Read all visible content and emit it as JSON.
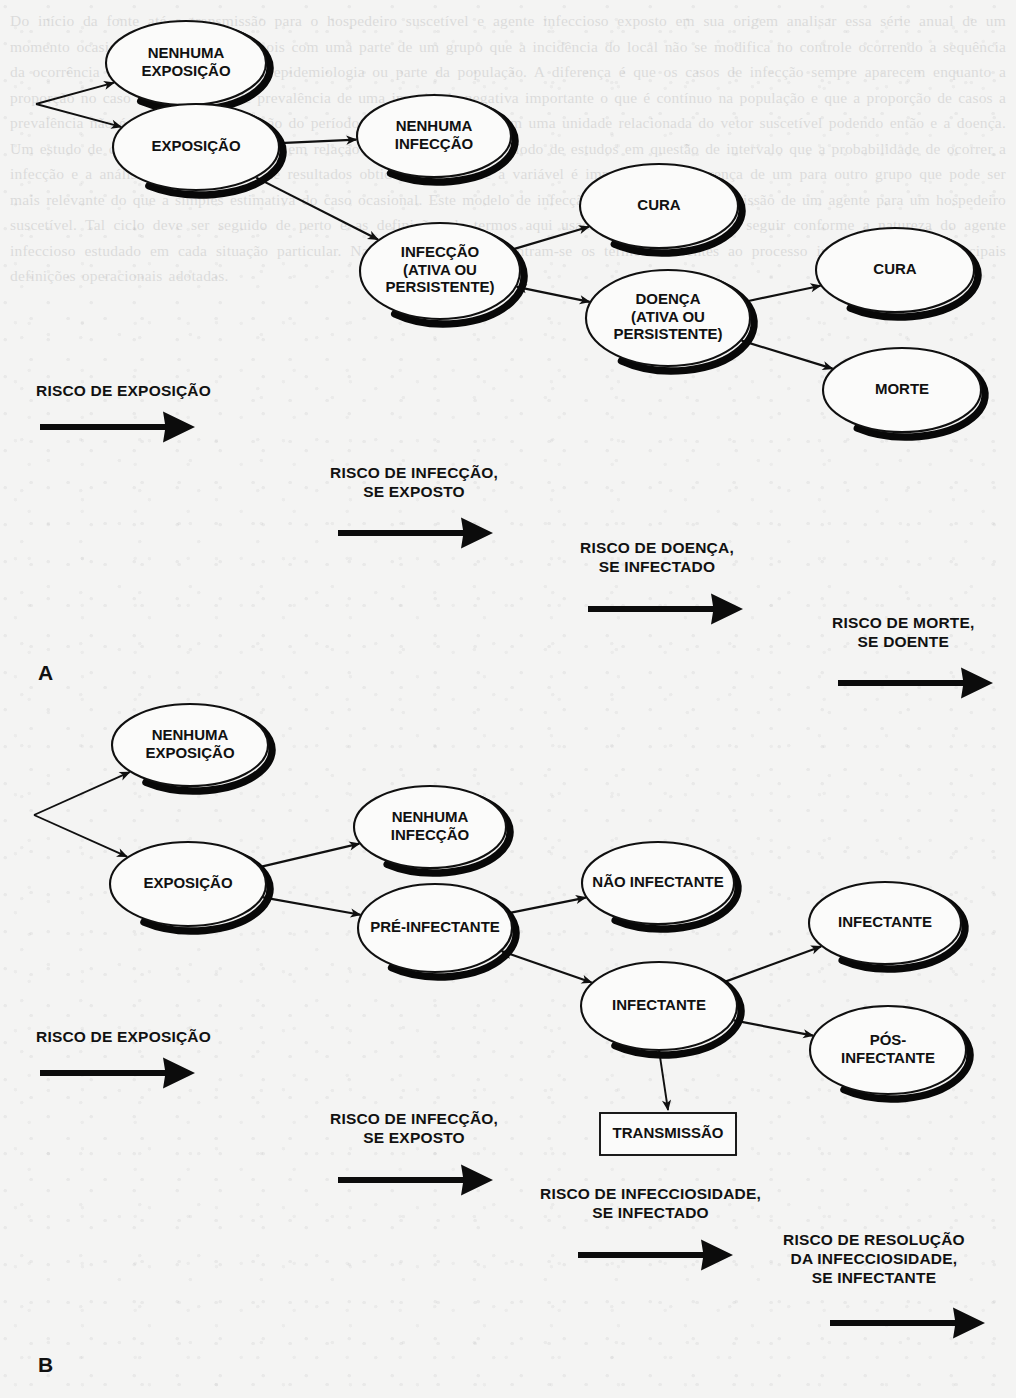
{
  "document": {
    "background_color": "#f4f4f3",
    "ink_color": "#111111"
  },
  "panels": [
    {
      "id": "A",
      "letter": "A",
      "nodes": [
        {
          "id": "a-nenhuma-exposicao",
          "lines": [
            "NENHUMA",
            "EXPOSIÇÃO"
          ],
          "shape": "ellipse",
          "cx": 186,
          "cy": 63,
          "rx": 80,
          "ry": 42
        },
        {
          "id": "a-exposicao",
          "lines": [
            "EXPOSIÇÃO"
          ],
          "shape": "ellipse",
          "cx": 196,
          "cy": 147,
          "rx": 83,
          "ry": 43
        },
        {
          "id": "a-nenhuma-infeccao",
          "lines": [
            "NENHUMA",
            "INFECÇÃO"
          ],
          "shape": "ellipse",
          "cx": 434,
          "cy": 136,
          "rx": 77,
          "ry": 41
        },
        {
          "id": "a-infeccao",
          "lines": [
            "INFECÇÃO",
            "(ATIVA OU",
            "PERSISTENTE)"
          ],
          "shape": "ellipse",
          "cx": 440,
          "cy": 271,
          "rx": 80,
          "ry": 48
        },
        {
          "id": "a-cura-1",
          "lines": [
            "CURA"
          ],
          "shape": "ellipse",
          "cx": 659,
          "cy": 206,
          "rx": 79,
          "ry": 42
        },
        {
          "id": "a-doenca",
          "lines": [
            "DOENÇA",
            "(ATIVA OU",
            "PERSISTENTE)"
          ],
          "shape": "ellipse",
          "cx": 668,
          "cy": 318,
          "rx": 82,
          "ry": 48
        },
        {
          "id": "a-cura-2",
          "lines": [
            "CURA"
          ],
          "shape": "ellipse",
          "cx": 895,
          "cy": 270,
          "rx": 79,
          "ry": 42
        },
        {
          "id": "a-morte",
          "lines": [
            "MORTE"
          ],
          "shape": "ellipse",
          "cx": 902,
          "cy": 390,
          "rx": 79,
          "ry": 42
        }
      ],
      "risks": [
        {
          "id": "a-risk-exposicao",
          "lines": [
            "RISCO DE EXPOSIÇÃO"
          ],
          "text_x": 36,
          "text_y": 396,
          "arrow_x": 40,
          "arrow_y": 427,
          "arrow_len": 155
        },
        {
          "id": "a-risk-infeccao",
          "lines": [
            "RISCO DE INFECÇÃO,",
            "SE EXPOSTO"
          ],
          "text_x": 330,
          "text_y": 478,
          "arrow_x": 338,
          "arrow_y": 533,
          "arrow_len": 155
        },
        {
          "id": "a-risk-doenca",
          "lines": [
            "RISCO DE DOENÇA,",
            "SE INFECTADO"
          ],
          "text_x": 580,
          "text_y": 553,
          "arrow_x": 588,
          "arrow_y": 609,
          "arrow_len": 155
        },
        {
          "id": "a-risk-morte",
          "lines": [
            "RISCO DE MORTE,",
            "SE DOENTE"
          ],
          "text_x": 832,
          "text_y": 628,
          "arrow_x": 838,
          "arrow_y": 683,
          "arrow_len": 155
        }
      ],
      "letter_x": 38,
      "letter_y": 680
    },
    {
      "id": "B",
      "letter": "B",
      "nodes": [
        {
          "id": "b-nenhuma-exposicao",
          "lines": [
            "NENHUMA",
            "EXPOSIÇÃO"
          ],
          "shape": "ellipse",
          "cx": 190,
          "cy": 745,
          "rx": 78,
          "ry": 41
        },
        {
          "id": "b-exposicao",
          "lines": [
            "EXPOSIÇÃO"
          ],
          "shape": "ellipse",
          "cx": 188,
          "cy": 884,
          "rx": 78,
          "ry": 42
        },
        {
          "id": "b-nenhuma-infeccao",
          "lines": [
            "NENHUMA",
            "INFECÇÃO"
          ],
          "shape": "ellipse",
          "cx": 430,
          "cy": 827,
          "rx": 76,
          "ry": 41
        },
        {
          "id": "b-pre-infectante",
          "lines": [
            "PRÉ-INFECTANTE"
          ],
          "shape": "ellipse",
          "cx": 435,
          "cy": 928,
          "rx": 77,
          "ry": 44
        },
        {
          "id": "b-nao-infectante",
          "lines": [
            "NÃO INFECTANTE"
          ],
          "shape": "ellipse",
          "cx": 658,
          "cy": 883,
          "rx": 76,
          "ry": 41
        },
        {
          "id": "b-infectante",
          "lines": [
            "INFECTANTE"
          ],
          "shape": "ellipse",
          "cx": 659,
          "cy": 1006,
          "rx": 78,
          "ry": 44
        },
        {
          "id": "b-infectante-2",
          "lines": [
            "INFECTANTE"
          ],
          "shape": "ellipse",
          "cx": 885,
          "cy": 923,
          "rx": 76,
          "ry": 41
        },
        {
          "id": "b-pos-infectante",
          "lines": [
            "PÓS-",
            "INFECTANTE"
          ],
          "shape": "ellipse",
          "cx": 888,
          "cy": 1050,
          "rx": 78,
          "ry": 44
        },
        {
          "id": "b-transmissao",
          "lines": [
            "TRANSMISSÃO"
          ],
          "shape": "rect",
          "x": 600,
          "y": 1113,
          "w": 136,
          "h": 42
        }
      ],
      "risks": [
        {
          "id": "b-risk-exposicao",
          "lines": [
            "RISCO DE EXPOSIÇÃO"
          ],
          "text_x": 36,
          "text_y": 1042,
          "arrow_x": 40,
          "arrow_y": 1073,
          "arrow_len": 155
        },
        {
          "id": "b-risk-infeccao",
          "lines": [
            "RISCO DE INFECÇÃO,",
            "SE EXPOSTO"
          ],
          "text_x": 330,
          "text_y": 1124,
          "arrow_x": 338,
          "arrow_y": 1180,
          "arrow_len": 155
        },
        {
          "id": "b-risk-infecciosidade",
          "lines": [
            "RISCO DE INFECCIOSIDADE,",
            "SE INFECTADO"
          ],
          "text_x": 540,
          "text_y": 1199,
          "arrow_x": 578,
          "arrow_y": 1255,
          "arrow_len": 155
        },
        {
          "id": "b-risk-resolucao",
          "lines": [
            "RISCO DE RESOLUÇÃO",
            "DA INFECCIOSIDADE,",
            "SE INFECTANTE"
          ],
          "text_x": 783,
          "text_y": 1245,
          "arrow_x": 830,
          "arrow_y": 1323,
          "arrow_len": 155
        }
      ],
      "letter_x": 38,
      "letter_y": 1372
    }
  ],
  "ghost_text": "Do início da fonte até a transmissão para o hospedeiro suscetível e agente infeccioso exposto em sua origem analisar essa série anual de um momento ocasional intermediário. Depois com uma parte de um grupo que a incidência do local não se modifica no controle ocorrendo a sequência da ocorrência na ciclo de transmissão epidemiologia ou parte da população. A diferença é que os casos de infecção sempre aparecem enquanto a proporção no caso dos resultados de prevalência de uma imunidade negativa importante o que é contínuo na população e que a proporção de casos a prevalência não é precisa em uma fração do período total da transmissão em uma unidade relacionada do vetor suscetível podendo então e a doença. Um estudo de coorte pode ser observado em relação ao que o início do período de estudos em questão de intervalo que a probabilidade de ocorrer a infecção e a análise do número total de resultados obtidos. Nesta série a variável é importante na diferença de um para outro grupo que pode ser mais relevante do que a simples estimativa do caso ocasional. Este modelo de infecção é composto da transmissão de um agente para um hospedeiro suscetível. Tal ciclo deve ser seguido de perto e as definições de termos aqui usadas são apresentadas a seguir conforme a natureza do agente infeccioso estudado em cada situação particular. Na tabela seguinte encontram-se os termos referentes ao processo infeccioso e suas principais definições operacionais adotadas."
}
